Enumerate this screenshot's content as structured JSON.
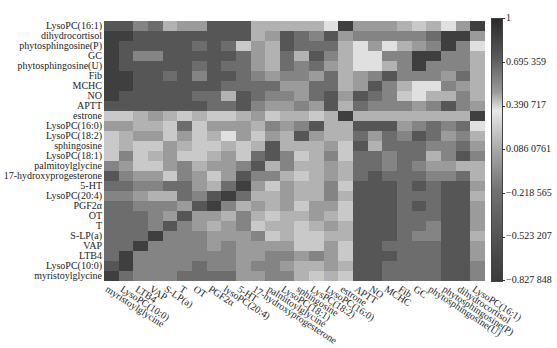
{
  "chart_data": {
    "type": "heatmap",
    "title": "",
    "xlabel": "",
    "ylabel": "",
    "row_labels": [
      "LysoPC(16:1)",
      "dihydrocortisol",
      "phytosphingosine(P)",
      "GC",
      "phytosphingosine(U)",
      "Fib",
      "MCHC",
      "NO",
      "APTT",
      "estrone",
      "LysoPC(16:0)",
      "LysoPC(18:2)",
      "sphingosine",
      "LysoPC(18:1)",
      "palmitoylglycine",
      "17-hydroxyprogesterone",
      "5-HT",
      "LysoPC(20:4)",
      "PGF2α",
      "OT",
      "T",
      "S-LP(a)",
      "VAP",
      "LTB4",
      "LysoPC(10:0)",
      "myristoylglycine"
    ],
    "col_labels": [
      "myristoylglycine",
      "LysoPC(10:0)",
      "LTB4",
      "VAP",
      "S-LP(a)",
      "T",
      "OT",
      "PGF2α",
      "lysoPC(20:4)",
      "5-HT",
      "17-hydroxyprogesterone",
      "palmitoylglycine",
      "LysoPC(18:1)",
      "sphingosine",
      "LysPC(18:2)",
      "LysoPC(16:0)",
      "estrone",
      "APTT",
      "NO",
      "MCHC",
      "Fib",
      "GC",
      "phytosphingosine(U)",
      "phytosphingosine(P)",
      "dihydrocortisol",
      "LysoPC(16:1)"
    ],
    "colorbar": {
      "ticks": [
        "1",
        "0.695 359",
        "0.390 717",
        "0.086 0761",
        "−0.218 565",
        "−0.523 207",
        "−0.827 848"
      ],
      "min": -0.827848,
      "max": 1
    },
    "gray_levels_note": "0=darkest,9=lightest per cell, rows top→bottom, cols left→right",
    "gray": [
      [
        2,
        2,
        4,
        3,
        6,
        5,
        5,
        2,
        2,
        2,
        6,
        6,
        6,
        6,
        6,
        8,
        1,
        5,
        5,
        5,
        6,
        7,
        6,
        8,
        5,
        1
      ],
      [
        1,
        1,
        2,
        2,
        2,
        2,
        2,
        2,
        2,
        2,
        6,
        5,
        2,
        3,
        4,
        2,
        5,
        4,
        4,
        4,
        4,
        4,
        3,
        1,
        1,
        5
      ],
      [
        1,
        2,
        2,
        2,
        2,
        2,
        3,
        2,
        3,
        7,
        5,
        6,
        2,
        3,
        3,
        3,
        6,
        8,
        5,
        8,
        6,
        5,
        4,
        1,
        4,
        8
      ],
      [
        1,
        2,
        4,
        4,
        2,
        2,
        2,
        2,
        2,
        3,
        5,
        6,
        3,
        6,
        2,
        4,
        6,
        8,
        8,
        4,
        4,
        1,
        1,
        4,
        4,
        6
      ],
      [
        1,
        2,
        2,
        2,
        2,
        2,
        3,
        2,
        3,
        3,
        5,
        6,
        3,
        4,
        3,
        5,
        6,
        8,
        8,
        6,
        4,
        1,
        4,
        4,
        4,
        6
      ],
      [
        1,
        1,
        2,
        2,
        3,
        2,
        4,
        2,
        2,
        3,
        4,
        5,
        4,
        4,
        5,
        3,
        6,
        5,
        4,
        2,
        4,
        4,
        4,
        5,
        3,
        6
      ],
      [
        1,
        1,
        2,
        2,
        2,
        2,
        2,
        2,
        3,
        3,
        3,
        3,
        5,
        5,
        3,
        3,
        6,
        5,
        2,
        4,
        6,
        8,
        8,
        4,
        5,
        6
      ],
      [
        1,
        2,
        2,
        2,
        2,
        2,
        3,
        3,
        6,
        2,
        3,
        4,
        4,
        5,
        3,
        2,
        5,
        2,
        3,
        4,
        7,
        8,
        6,
        6,
        4,
        6
      ],
      [
        2,
        2,
        2,
        2,
        2,
        2,
        2,
        3,
        3,
        2,
        4,
        5,
        5,
        4,
        5,
        2,
        6,
        3,
        4,
        4,
        4,
        5,
        4,
        2,
        4,
        5
      ],
      [
        7,
        7,
        6,
        5,
        6,
        7,
        6,
        7,
        7,
        6,
        5,
        7,
        6,
        6,
        7,
        6,
        1,
        6,
        6,
        6,
        6,
        6,
        6,
        6,
        6,
        1
      ],
      [
        5,
        5,
        6,
        6,
        7,
        3,
        7,
        5,
        5,
        5,
        6,
        4,
        5,
        4,
        2,
        6,
        6,
        2,
        2,
        2,
        5,
        4,
        3,
        4,
        3,
        8
      ],
      [
        7,
        6,
        5,
        5,
        7,
        5,
        7,
        6,
        8,
        5,
        7,
        5,
        6,
        2,
        5,
        6,
        6,
        3,
        5,
        3,
        4,
        2,
        3,
        5,
        4,
        6
      ],
      [
        7,
        6,
        7,
        7,
        5,
        6,
        7,
        7,
        6,
        7,
        6,
        2,
        6,
        6,
        6,
        5,
        7,
        2,
        6,
        3,
        3,
        3,
        4,
        4,
        3,
        5
      ],
      [
        7,
        4,
        7,
        6,
        5,
        7,
        7,
        6,
        5,
        7,
        3,
        2,
        4,
        7,
        6,
        4,
        7,
        3,
        3,
        4,
        3,
        3,
        6,
        4,
        2,
        4
      ],
      [
        4,
        5,
        7,
        7,
        5,
        4,
        6,
        5,
        5,
        4,
        2,
        6,
        4,
        6,
        6,
        5,
        6,
        3,
        3,
        4,
        3,
        4,
        5,
        5,
        6,
        6
      ],
      [
        2,
        4,
        5,
        5,
        7,
        4,
        5,
        7,
        5,
        2,
        4,
        4,
        6,
        7,
        6,
        5,
        6,
        3,
        2,
        3,
        3,
        3,
        4,
        4,
        3,
        6
      ],
      [
        3,
        3,
        4,
        4,
        3,
        3,
        5,
        6,
        3,
        1,
        5,
        7,
        5,
        6,
        6,
        4,
        7,
        2,
        2,
        2,
        3,
        2,
        3,
        2,
        2,
        5
      ],
      [
        4,
        4,
        5,
        6,
        6,
        3,
        4,
        2,
        1,
        3,
        6,
        6,
        5,
        6,
        6,
        4,
        6,
        2,
        2,
        2,
        3,
        3,
        3,
        2,
        2,
        6
      ],
      [
        3,
        3,
        4,
        4,
        4,
        5,
        2,
        1,
        4,
        6,
        5,
        6,
        5,
        7,
        5,
        5,
        7,
        2,
        2,
        2,
        3,
        2,
        3,
        2,
        2,
        5
      ],
      [
        3,
        3,
        3,
        4,
        5,
        2,
        5,
        5,
        6,
        4,
        6,
        7,
        6,
        6,
        5,
        6,
        7,
        2,
        2,
        2,
        3,
        3,
        3,
        2,
        2,
        5
      ],
      [
        3,
        3,
        3,
        4,
        2,
        4,
        5,
        6,
        5,
        4,
        7,
        6,
        6,
        7,
        6,
        5,
        6,
        2,
        2,
        2,
        3,
        3,
        4,
        2,
        2,
        5
      ],
      [
        3,
        3,
        3,
        1,
        4,
        4,
        4,
        5,
        5,
        5,
        4,
        7,
        6,
        7,
        7,
        6,
        6,
        2,
        2,
        2,
        3,
        4,
        4,
        2,
        2,
        6
      ],
      [
        3,
        3,
        1,
        4,
        4,
        4,
        4,
        5,
        4,
        5,
        5,
        5,
        5,
        7,
        7,
        5,
        7,
        2,
        2,
        3,
        3,
        3,
        3,
        2,
        2,
        5
      ],
      [
        3,
        1,
        4,
        4,
        4,
        4,
        4,
        4,
        4,
        5,
        5,
        4,
        4,
        5,
        4,
        5,
        7,
        2,
        2,
        2,
        3,
        3,
        3,
        2,
        2,
        5
      ],
      [
        2,
        1,
        4,
        4,
        4,
        4,
        3,
        4,
        4,
        5,
        4,
        4,
        5,
        6,
        6,
        5,
        6,
        2,
        2,
        3,
        3,
        3,
        3,
        2,
        2,
        4
      ],
      [
        1,
        3,
        4,
        4,
        4,
        3,
        3,
        3,
        3,
        5,
        5,
        4,
        4,
        6,
        7,
        6,
        7,
        2,
        2,
        3,
        3,
        3,
        3,
        2,
        2,
        4
      ]
    ]
  }
}
